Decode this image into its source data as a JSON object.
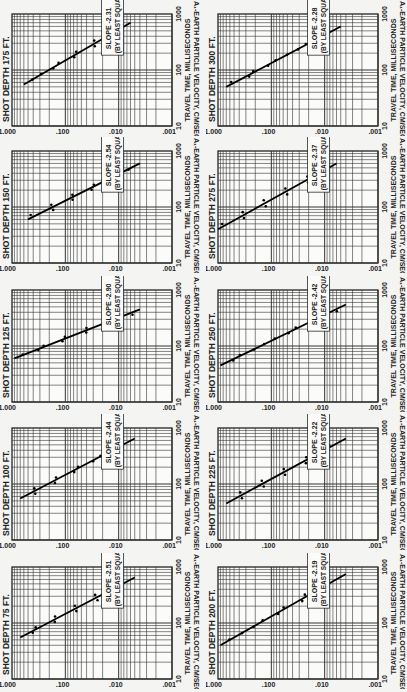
{
  "x_axis_label": "A₁-EARTH PARTICLE VELOCITY, CM/SEC",
  "y_axis_label": "TRAVEL TIME, MILLISECONDS",
  "x_ticks": [
    "1.000",
    ".100",
    ".010",
    ".001"
  ],
  "y_ticks": [
    "10",
    "100",
    "1000"
  ],
  "slope_note": "(BY LEAST SQUARES)",
  "panels": [
    {
      "title": "SHOT DEPTH 175 FT.",
      "slope": "SLOPE -2.31"
    },
    {
      "title": "SHOT DEPTH 300 FT.",
      "slope": "SLOPE -2.28"
    },
    {
      "title": "SHOT DEPTH 150 FT.",
      "slope": "SLOPE -2.54"
    },
    {
      "title": "SHOT DEPTH 275 FT.",
      "slope": "SLOPE -2.37"
    },
    {
      "title": "SHOT DEPTH 125 FT.",
      "slope": "SLOPE -2.90"
    },
    {
      "title": "SHOT DEPTH 250 FT.",
      "slope": "SLOPE -2.42"
    },
    {
      "title": "SHOT DEPTH 100 FT.",
      "slope": "SLOPE -2.44"
    },
    {
      "title": "SHOT DEPTH 225 FT.",
      "slope": "SLOPE -2.22"
    },
    {
      "title": "SHOT DEPTH 75 FT.",
      "slope": "SLOPE -2.51"
    },
    {
      "title": "SHOT DEPTH 200 FT.",
      "slope": "SLOPE -2.19"
    }
  ],
  "chart_data": [
    {
      "type": "scatter",
      "title": "SHOT DEPTH 175 FT.",
      "xlabel": "TRAVEL TIME, MILLISECONDS",
      "ylabel": "A₁-EARTH PARTICLE VELOCITY, CM/SEC",
      "x_scale": "log",
      "y_scale": "log",
      "xlim": [
        10,
        1000
      ],
      "ylim": [
        0.001,
        1.0
      ],
      "slope": -2.31,
      "fit": "least squares",
      "line": [
        [
          55,
          0.6
        ],
        [
          700,
          0.006
        ]
      ]
    },
    {
      "type": "scatter",
      "title": "SHOT DEPTH 300 FT.",
      "xlabel": "TRAVEL TIME, MILLISECONDS",
      "ylabel": "A₁-EARTH PARTICLE VELOCITY, CM/SEC",
      "x_scale": "log",
      "y_scale": "log",
      "xlim": [
        10,
        1000
      ],
      "ylim": [
        0.001,
        1.0
      ],
      "slope": -2.28,
      "fit": "least squares",
      "line": [
        [
          50,
          0.7
        ],
        [
          600,
          0.005
        ]
      ]
    },
    {
      "type": "scatter",
      "title": "SHOT DEPTH 150 FT.",
      "xlabel": "TRAVEL TIME, MILLISECONDS",
      "ylabel": "A₁-EARTH PARTICLE VELOCITY, CM/SEC",
      "x_scale": "log",
      "y_scale": "log",
      "xlim": [
        10,
        1000
      ],
      "ylim": [
        0.001,
        1.0
      ],
      "slope": -2.54,
      "fit": "least squares",
      "line": [
        [
          60,
          0.5
        ],
        [
          600,
          0.004
        ]
      ]
    },
    {
      "type": "scatter",
      "title": "SHOT DEPTH 275 FT.",
      "xlabel": "TRAVEL TIME, MILLISECONDS",
      "ylabel": "A₁-EARTH PARTICLE VELOCITY, CM/SEC",
      "x_scale": "log",
      "y_scale": "log",
      "xlim": [
        10,
        1000
      ],
      "ylim": [
        0.001,
        1.0
      ],
      "slope": -2.37,
      "fit": "least squares",
      "line": [
        [
          40,
          1.0
        ],
        [
          600,
          0.006
        ]
      ]
    },
    {
      "type": "scatter",
      "title": "SHOT DEPTH 125 FT.",
      "xlabel": "TRAVEL TIME, MILLISECONDS",
      "ylabel": "A₁-EARTH PARTICLE VELOCITY, CM/SEC",
      "x_scale": "log",
      "y_scale": "log",
      "xlim": [
        10,
        1000
      ],
      "ylim": [
        0.001,
        1.0
      ],
      "slope": -2.9,
      "fit": "least squares",
      "line": [
        [
          60,
          0.9
        ],
        [
          450,
          0.004
        ]
      ]
    },
    {
      "type": "scatter",
      "title": "SHOT DEPTH 250 FT.",
      "xlabel": "TRAVEL TIME, MILLISECONDS",
      "ylabel": "A₁-EARTH PARTICLE VELOCITY, CM/SEC",
      "x_scale": "log",
      "y_scale": "log",
      "xlim": [
        10,
        1000
      ],
      "ylim": [
        0.001,
        1.0
      ],
      "slope": -2.42,
      "fit": "least squares",
      "line": [
        [
          45,
          0.9
        ],
        [
          550,
          0.004
        ]
      ]
    },
    {
      "type": "scatter",
      "title": "SHOT DEPTH 100 FT.",
      "xlabel": "TRAVEL TIME, MILLISECONDS",
      "ylabel": "A₁-EARTH PARTICLE VELOCITY, CM/SEC",
      "x_scale": "log",
      "y_scale": "log",
      "xlim": [
        10,
        1000
      ],
      "ylim": [
        0.001,
        1.0
      ],
      "slope": -2.44,
      "fit": "least squares",
      "line": [
        [
          55,
          0.7
        ],
        [
          650,
          0.005
        ]
      ]
    },
    {
      "type": "scatter",
      "title": "SHOT DEPTH 225 FT.",
      "xlabel": "TRAVEL TIME, MILLISECONDS",
      "ylabel": "A₁-EARTH PARTICLE VELOCITY, CM/SEC",
      "x_scale": "log",
      "y_scale": "log",
      "xlim": [
        10,
        1000
      ],
      "ylim": [
        0.001,
        1.0
      ],
      "slope": -2.22,
      "fit": "least squares",
      "line": [
        [
          45,
          0.7
        ],
        [
          650,
          0.004
        ]
      ]
    },
    {
      "type": "scatter",
      "title": "SHOT DEPTH 75 FT.",
      "xlabel": "TRAVEL TIME, MILLISECONDS",
      "ylabel": "A₁-EARTH PARTICLE VELOCITY, CM/SEC",
      "x_scale": "log",
      "y_scale": "log",
      "xlim": [
        10,
        1000
      ],
      "ylim": [
        0.001,
        1.0
      ],
      "slope": -2.51,
      "fit": "least squares",
      "line": [
        [
          55,
          0.7
        ],
        [
          650,
          0.005
        ]
      ]
    },
    {
      "type": "scatter",
      "title": "SHOT DEPTH 200 FT.",
      "xlabel": "TRAVEL TIME, MILLISECONDS",
      "ylabel": "A₁-EARTH PARTICLE VELOCITY, CM/SEC",
      "x_scale": "log",
      "y_scale": "log",
      "xlim": [
        10,
        1000
      ],
      "ylim": [
        0.001,
        1.0
      ],
      "slope": -2.19,
      "fit": "least squares",
      "line": [
        [
          40,
          0.9
        ],
        [
          750,
          0.004
        ]
      ]
    }
  ]
}
